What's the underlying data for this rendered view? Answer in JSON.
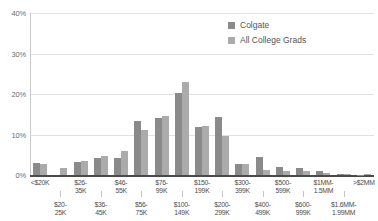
{
  "chart_data": {
    "type": "bar",
    "title": "",
    "xlabel": "",
    "ylabel": "",
    "ylim": [
      0,
      40
    ],
    "ytick_labels": [
      "0%",
      "10%",
      "20%",
      "30%",
      "40%"
    ],
    "ytick_values": [
      0,
      10,
      20,
      30,
      40
    ],
    "grid": true,
    "legend_position": "top-right",
    "categories": [
      "<$20K",
      "$20-25K",
      "$26-35K",
      "$36-45K",
      "$46-55K",
      "$56-75K",
      "$76-99K",
      "$100-149K",
      "$150-199K",
      "$200-299K",
      "$300-399K",
      "$400-499K",
      "$500-599K",
      "$600-999K",
      "$1MM-1.5MM",
      "$1.6MM-1.99MM",
      ">$2MM"
    ],
    "category_lines": [
      [
        "<$20K",
        ""
      ],
      [
        "$20-",
        "25K"
      ],
      [
        "$26-",
        "35K"
      ],
      [
        "$36-",
        "45K"
      ],
      [
        "$46-",
        "55K"
      ],
      [
        "$56-",
        "75K"
      ],
      [
        "$76-",
        "99K"
      ],
      [
        "$100-",
        "149K"
      ],
      [
        "$150-",
        "199K"
      ],
      [
        "$200-",
        "299K"
      ],
      [
        "$300-",
        "399K"
      ],
      [
        "$400-",
        "499K"
      ],
      [
        "$500-",
        "599K"
      ],
      [
        "$600-",
        "999K"
      ],
      [
        "$1MM-",
        "1.5MM"
      ],
      [
        "$1.6MM-",
        "1.99MM"
      ],
      [
        ">$2MM",
        ""
      ]
    ],
    "series": [
      {
        "name": "Colgate",
        "color": "#8a8a8a",
        "values": [
          3.0,
          0.0,
          3.2,
          4.1,
          4.1,
          13.4,
          14.2,
          20.3,
          11.9,
          14.4,
          2.6,
          4.5,
          1.9,
          1.8,
          0.9,
          0.2,
          0.1
        ]
      },
      {
        "name": "All College Grads",
        "color": "#ababab",
        "values": [
          2.8,
          1.7,
          3.5,
          4.8,
          6.0,
          11.1,
          14.5,
          23.0,
          12.2,
          9.6,
          2.7,
          1.3,
          1.0,
          1.0,
          0.5,
          0.2,
          0.3
        ]
      }
    ]
  },
  "legend": {
    "items": [
      {
        "label": "Colgate"
      },
      {
        "label": "All College Grads"
      }
    ]
  }
}
